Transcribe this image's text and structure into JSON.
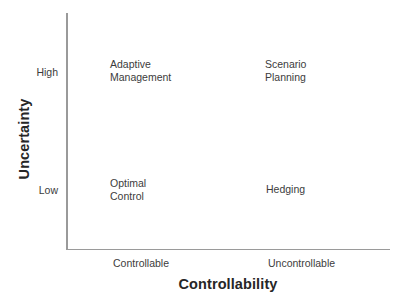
{
  "chart_data": {
    "type": "scatter",
    "title": "",
    "xlabel": "Controllability",
    "ylabel": "Uncertainty",
    "x_tick_labels": [
      "Controllable",
      "Uncontrollable"
    ],
    "y_tick_labels": [
      "High",
      "Low"
    ],
    "grid": false,
    "legend": "none",
    "axis_color": "#9a9a9a",
    "text_color": "#3c3c3c",
    "title_color": "#262626",
    "background": "#ffffff",
    "quadrants": [
      {
        "id": "top-left",
        "x": "Controllable",
        "y": "High",
        "label": "Adaptive\nManagement"
      },
      {
        "id": "top-right",
        "x": "Uncontrollable",
        "y": "High",
        "label": "Scenario\nPlanning"
      },
      {
        "id": "bottom-left",
        "x": "Controllable",
        "y": "Low",
        "label": "Optimal\nControl"
      },
      {
        "id": "bottom-right",
        "x": "Uncontrollable",
        "y": "Low",
        "label": "Hedging"
      }
    ]
  },
  "axes": {
    "y_title": "Uncertainty",
    "x_title": "Controllability",
    "y_ticks": {
      "high": "High",
      "low": "Low"
    },
    "x_ticks": {
      "left": "Controllable",
      "right": "Uncontrollable"
    }
  }
}
